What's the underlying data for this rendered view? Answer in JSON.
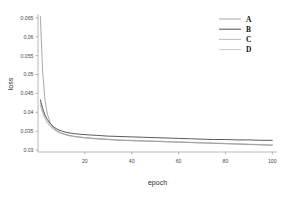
{
  "chart_data": {
    "type": "line",
    "title": "",
    "xlabel": "epoch",
    "ylabel": "loss",
    "xlim": [
      0,
      102
    ],
    "ylim": [
      0.0295,
      0.0655
    ],
    "grid": false,
    "legend_position": "top-right",
    "xticks": [
      "20",
      "40",
      "60",
      "80",
      "100"
    ],
    "xtick_values": [
      20,
      40,
      60,
      80,
      100
    ],
    "yticks": [
      "0.065",
      "0.06",
      "0.055",
      "0.05",
      "0.045",
      "0.04",
      "0.035",
      "0.03"
    ],
    "ytick_values": [
      0.065,
      0.06,
      0.055,
      0.05,
      0.045,
      0.04,
      0.035,
      0.03
    ],
    "x": [
      1,
      2,
      3,
      4,
      5,
      6,
      7,
      8,
      9,
      10,
      12,
      14,
      16,
      18,
      20,
      25,
      30,
      35,
      40,
      45,
      50,
      55,
      60,
      65,
      70,
      75,
      80,
      85,
      90,
      95,
      100
    ],
    "series": [
      {
        "name": "A",
        "color": "#9a9a9a",
        "values": [
          0.0654,
          0.0505,
          0.0432,
          0.0396,
          0.0376,
          0.0364,
          0.0357,
          0.0352,
          0.0348,
          0.0345,
          0.0341,
          0.0338,
          0.0336,
          0.0334,
          0.0333,
          0.033,
          0.0328,
          0.0326,
          0.0325,
          0.0324,
          0.0323,
          0.0322,
          0.0321,
          0.032,
          0.0319,
          0.0318,
          0.0317,
          0.0316,
          0.0315,
          0.0314,
          0.0313
        ]
      },
      {
        "name": "B",
        "color": "#3c3c3c",
        "values": [
          0.0433,
          0.041,
          0.0393,
          0.0381,
          0.0372,
          0.0365,
          0.036,
          0.0356,
          0.0353,
          0.0351,
          0.0347,
          0.0345,
          0.0343,
          0.0342,
          0.0341,
          0.0339,
          0.0337,
          0.0336,
          0.0335,
          0.0334,
          0.0333,
          0.0332,
          0.0331,
          0.033,
          0.0329,
          0.0328,
          0.0328,
          0.0327,
          0.0327,
          0.0326,
          0.0326
        ]
      },
      {
        "name": "C",
        "color": "#b4b4b4",
        "values": [
          0.0418,
          0.0398,
          0.0383,
          0.0372,
          0.0364,
          0.0358,
          0.0353,
          0.0349,
          0.0346,
          0.0344,
          0.034,
          0.0337,
          0.0335,
          0.0334,
          0.0332,
          0.033,
          0.0328,
          0.0326,
          0.0325,
          0.0324,
          0.0323,
          0.0322,
          0.0321,
          0.032,
          0.0319,
          0.0318,
          0.0317,
          0.0316,
          0.0315,
          0.0314,
          0.0313
        ]
      },
      {
        "name": "D",
        "color": "#c2c2c2",
        "values": [
          0.0425,
          0.0403,
          0.0387,
          0.0375,
          0.0367,
          0.036,
          0.0355,
          0.0351,
          0.0348,
          0.0345,
          0.0341,
          0.0338,
          0.0336,
          0.0335,
          0.0333,
          0.0331,
          0.0329,
          0.0327,
          0.0326,
          0.0325,
          0.0324,
          0.0323,
          0.0322,
          0.0321,
          0.032,
          0.0319,
          0.0318,
          0.0317,
          0.0316,
          0.0315,
          0.0314
        ]
      }
    ]
  },
  "legend": {
    "entries": [
      {
        "label": "A"
      },
      {
        "label": "B"
      },
      {
        "label": "C"
      },
      {
        "label": "D"
      }
    ]
  },
  "axes": {
    "x_title": "epoch",
    "y_title": "loss"
  },
  "colors": {
    "axis": "#8c8c8c",
    "tick_text": "#4a4a4a",
    "title_text": "#2b2b2b",
    "background": "#ffffff"
  }
}
